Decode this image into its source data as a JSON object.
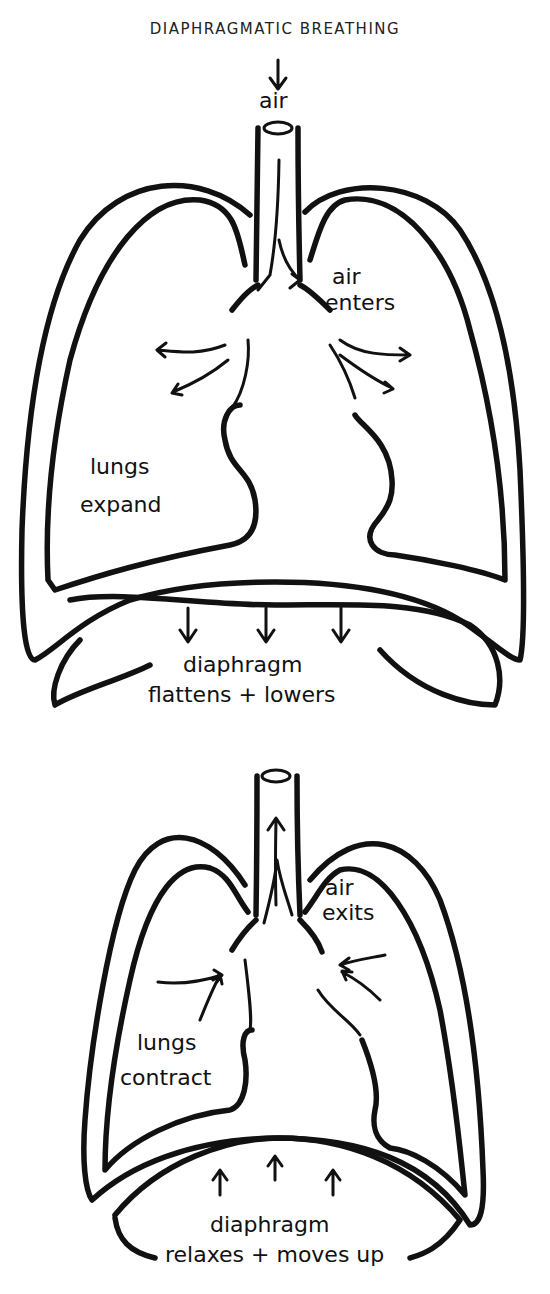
{
  "title": "DIAPHRAGMATIC BREATHING",
  "inhale": {
    "air_label": "air",
    "air_enters_line1": "air",
    "air_enters_line2": "enters",
    "lungs_line1": "lungs",
    "lungs_line2": "expand",
    "diaphragm_line1": "diaphragm",
    "diaphragm_line2": "flattens + lowers"
  },
  "exhale": {
    "air_exits_line1": "air",
    "air_exits_line2": "exits",
    "lungs_line1": "lungs",
    "lungs_line2": "contract",
    "diaphragm_line1": "diaphragm",
    "diaphragm_line2": "relaxes + moves up"
  }
}
